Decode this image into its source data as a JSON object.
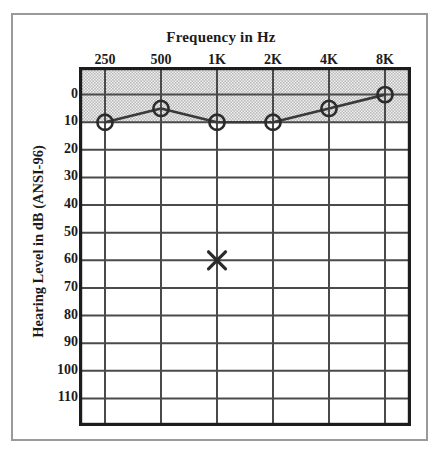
{
  "chart_data": {
    "type": "line",
    "title": "Frequency in Hz",
    "xlabel": "Frequency in Hz",
    "ylabel": "Hearing Level in dB (ANSI-96)",
    "categories": [
      "250",
      "500",
      "1K",
      "2K",
      "4K",
      "8K"
    ],
    "x_tick_labels": [
      "250",
      "500",
      "1K",
      "2K",
      "4K",
      "8K"
    ],
    "y_tick_labels": [
      "0",
      "10",
      "20",
      "30",
      "40",
      "50",
      "60",
      "70",
      "80",
      "90",
      "100",
      "110"
    ],
    "y_tick_values": [
      0,
      10,
      20,
      30,
      40,
      50,
      60,
      70,
      80,
      90,
      100,
      110
    ],
    "ylim": [
      -10,
      120
    ],
    "y_inverted": true,
    "grid": true,
    "legend": "none",
    "series": [
      {
        "name": "Air conduction (right ear)",
        "marker": "circle",
        "values": [
          10,
          5,
          10,
          10,
          5,
          0
        ]
      },
      {
        "name": "Masked air conduction (left ear)",
        "marker": "x",
        "points": [
          {
            "x": "1K",
            "y": 60
          }
        ]
      }
    ],
    "annotations": [
      {
        "label": "normal hearing shaded band",
        "y_from": -10,
        "y_to": 10,
        "fill": "#d4d4d4"
      }
    ],
    "colors": {
      "line": "#3a3a3a",
      "marker": "#2b2b2b",
      "grid": "#4a4a4a",
      "axis": "#1c1c1c",
      "shaded_band": "#d6d6d6",
      "outer_frame": "#9a9a9a",
      "background": "#ffffff"
    }
  }
}
